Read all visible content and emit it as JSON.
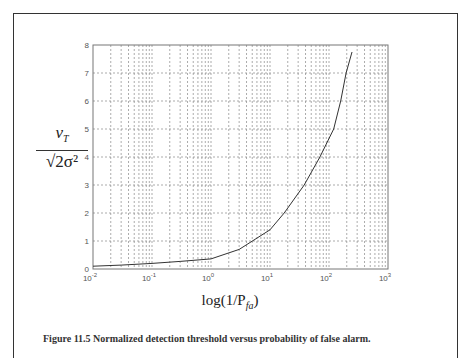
{
  "figure": {
    "ylabel_numerator": "v",
    "ylabel_numerator_sub": "T",
    "ylabel_denominator": "√2σ²",
    "xlabel": "log(1/P",
    "xlabel_sub": "fa",
    "xlabel_close": ")",
    "caption": "Figure 11.5 Normalized detection threshold versus probability of false alarm."
  },
  "chart_data": {
    "type": "line",
    "title": "",
    "xlabel": "log(1/P_fa)",
    "ylabel": "v_T / sqrt(2σ²)",
    "xscale": "log",
    "xlim": [
      0.01,
      1000
    ],
    "ylim": [
      0,
      8
    ],
    "grid": true,
    "x_ticks": [
      "10^-2",
      "10^-1",
      "10^0",
      "10^1",
      "10^2",
      "10^3"
    ],
    "y_ticks": [
      "0",
      "1",
      "2",
      "3",
      "4",
      "5",
      "6",
      "7",
      "8"
    ],
    "series": [
      {
        "name": "threshold",
        "x": [
          0.01,
          0.03,
          0.1,
          0.3,
          1,
          3,
          10,
          17.4,
          38,
          70,
          120,
          158,
          195,
          245
        ],
        "y": [
          0.1,
          0.14,
          0.2,
          0.27,
          0.36,
          0.7,
          1.4,
          2.0,
          3.0,
          4.0,
          5.0,
          6.0,
          7.0,
          7.75
        ]
      }
    ],
    "legend": []
  }
}
